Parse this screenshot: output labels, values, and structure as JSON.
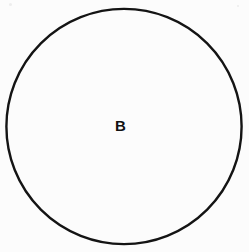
{
  "figure": {
    "type": "venn-single-set",
    "background_color": "#fcfcfc",
    "stroke_color": "#141414",
    "label_color": "#111111"
  },
  "shapes": [
    {
      "name": "circle-b",
      "shape": "circle",
      "center_x": 124,
      "center_y": 126,
      "radius": 118,
      "stroke_width": 2.4,
      "stroke": "#141414",
      "fill": "none"
    }
  ],
  "labels": {
    "set_b": "B"
  }
}
